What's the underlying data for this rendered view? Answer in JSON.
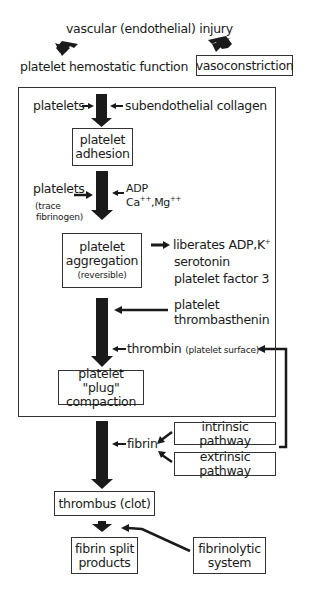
{
  "diagram": {
    "title": "vascular (endothelial) injury",
    "branch_left": "platelet hemostatic function",
    "branch_right": "vasoconstriction",
    "adhesion_inputs": {
      "left": "platelets",
      "right": "subendothelial collagen"
    },
    "adhesion_box": [
      "platelet",
      "adhesion"
    ],
    "aggregation_inputs": {
      "left": "platelets",
      "left_note_1": "(trace",
      "left_note_2": "fibrinogen)",
      "right_line1": "ADP",
      "right_line2_a": "Ca",
      "right_line2_a_sup": "++",
      "right_line2_b": ",Mg",
      "right_line2_b_sup": "++"
    },
    "aggregation_box": {
      "line1": "platelet",
      "line2": "aggregation",
      "note": "(reversible)"
    },
    "aggregation_outputs": {
      "line1": "liberates ADP,K",
      "line1_sup": "+",
      "line2": "serotonin",
      "line3": "platelet factor 3"
    },
    "thrombasthenin": [
      "platelet",
      "thrombasthenin"
    ],
    "thrombin": {
      "label": "thrombin",
      "note": "(platelet surface)"
    },
    "plug_box": [
      "platelet \"plug\"",
      "compaction"
    ],
    "fibrin": "fibrin",
    "intrinsic": "intrinsic pathway",
    "extrinsic": "extrinsic pathway",
    "thrombus_box": "thrombus (clot)",
    "split_box": [
      "fibrin split",
      "products"
    ],
    "fibrinolytic_box": [
      "fibrinolytic",
      "system"
    ],
    "colors": {
      "ink": "#1a1a1a",
      "arrow": "#1a1a1a",
      "background": "#ffffff"
    }
  }
}
